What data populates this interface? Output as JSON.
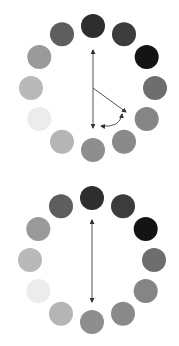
{
  "caption": {
    "text": "…"
  },
  "dial_radius": 62,
  "dot_radius": 12,
  "dot_colors": [
    "#2e2e2e",
    "#3c3c3c",
    "#141414",
    "#6e6e6e",
    "#858585",
    "#8a8a8a",
    "#8e8e8e",
    "#b5b5b5",
    "#ececec",
    "#b9b9b9",
    "#9a9a9a",
    "#5e5e5e"
  ],
  "arrow_color": "#555555",
  "top_clock": {
    "center": [
      93,
      88
    ],
    "arrows": [
      {
        "type": "double",
        "from": [
          93,
          50
        ],
        "to": [
          93,
          128
        ]
      },
      {
        "type": "single",
        "from": [
          93,
          88
        ],
        "to": [
          126,
          112
        ]
      },
      {
        "type": "curved-double",
        "from": [
          101,
          126
        ],
        "to": [
          122,
          114
        ]
      }
    ]
  },
  "bottom_clock": {
    "center": [
      92,
      260
    ],
    "arrows": [
      {
        "type": "double",
        "from": [
          92,
          220
        ],
        "to": [
          92,
          302
        ]
      }
    ]
  }
}
